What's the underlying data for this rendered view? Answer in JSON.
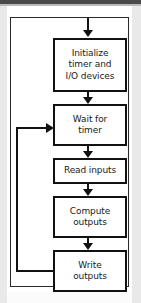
{
  "diagram": {
    "type": "flowchart",
    "colors": {
      "node_border": "#111111",
      "node_fill": "#ffffff",
      "frame_border": "#2a2a2a",
      "connector": "#111111",
      "text": "#1a1a1a",
      "page_margin": "#e9e9e9",
      "top_bar": "#4a4a4a"
    },
    "entry_arrow": {
      "name": "entry-arrow",
      "direction": "down"
    },
    "nodes": [
      {
        "id": "initialize",
        "name": "node-initialize",
        "shape": "rectangle",
        "lines": [
          "Initialize",
          "timer and",
          "I/O devices"
        ],
        "text": "Initialize timer and I/O devices"
      },
      {
        "id": "wait",
        "name": "node-wait-for-timer",
        "shape": "rectangle",
        "lines": [
          "Wait for",
          "timer"
        ],
        "text": "Wait for timer"
      },
      {
        "id": "read",
        "name": "node-read-inputs",
        "shape": "rectangle",
        "lines": [
          "Read inputs"
        ],
        "text": "Read inputs"
      },
      {
        "id": "compute",
        "name": "node-compute-outputs",
        "shape": "rectangle",
        "lines": [
          "Compute",
          "outputs"
        ],
        "text": "Compute outputs"
      },
      {
        "id": "write",
        "name": "node-write-outputs",
        "shape": "rectangle",
        "lines": [
          "Write",
          "outputs"
        ],
        "text": "Write outputs"
      }
    ],
    "edges": [
      {
        "id": "entry",
        "from": "start",
        "to": "initialize",
        "label": "",
        "style": "arrow-down"
      },
      {
        "id": "init-to-wait",
        "from": "initialize",
        "to": "wait",
        "label": "",
        "style": "arrow-down"
      },
      {
        "id": "wait-to-read",
        "from": "wait",
        "to": "read",
        "label": "",
        "style": "arrow-down"
      },
      {
        "id": "read-to-compute",
        "from": "read",
        "to": "compute",
        "label": "",
        "style": "arrow-down"
      },
      {
        "id": "compute-to-write",
        "from": "compute",
        "to": "write",
        "label": "",
        "style": "arrow-down"
      },
      {
        "id": "write-to-wait",
        "from": "write",
        "to": "wait",
        "label": "",
        "style": "feedback-loop-left"
      }
    ]
  }
}
